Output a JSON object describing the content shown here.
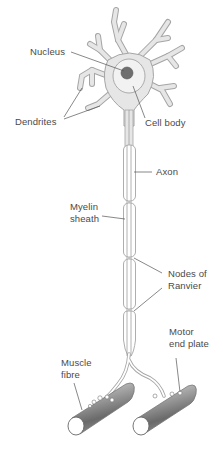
{
  "diagram": {
    "labels": {
      "nucleus": "Nucleus",
      "dendrites": "Dendrites",
      "cell_body": "Cell body",
      "axon": "Axon",
      "myelin_line1": "Myelin",
      "myelin_line2": "sheath",
      "nodes_line1": "Nodes of",
      "nodes_line2": "Ranvier",
      "muscle_line1": "Muscle",
      "muscle_line2": "fibre",
      "motor_line1": "Motor",
      "motor_line2": "end plate"
    },
    "colors": {
      "cell_fill": "#e6e6e6",
      "outline": "#9a9a9a",
      "nucleus": "#6e6e6e",
      "muscle_dark": "#6f6f6f",
      "muscle_light": "#d8d8d8",
      "leader_line": "#555555",
      "text": "#4a4a4a"
    }
  }
}
